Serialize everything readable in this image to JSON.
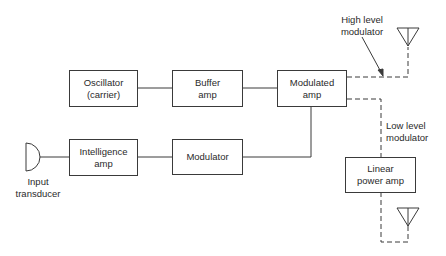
{
  "diagram": {
    "blocks": {
      "oscillator": {
        "line1": "Oscillator",
        "line2": "(carrier)"
      },
      "buffer": {
        "line1": "Buffer",
        "line2": "amp"
      },
      "modulated_amp": {
        "line1": "Modulated",
        "line2": "amp"
      },
      "intelligence_amp": {
        "line1": "Intelligence",
        "line2": "amp"
      },
      "modulator": {
        "line1": "Modulator"
      },
      "linear_power_amp": {
        "line1": "Linear",
        "line2": "power amp"
      }
    },
    "labels": {
      "input_transducer": {
        "line1": "Input",
        "line2": "transducer"
      },
      "high_level": {
        "line1": "High level",
        "line2": "modulator"
      },
      "low_level": {
        "line1": "Low level",
        "line2": "modulator"
      }
    },
    "colors": {
      "line": "#3a3a3a",
      "text": "#2a2a2a",
      "background": "#ffffff"
    }
  }
}
